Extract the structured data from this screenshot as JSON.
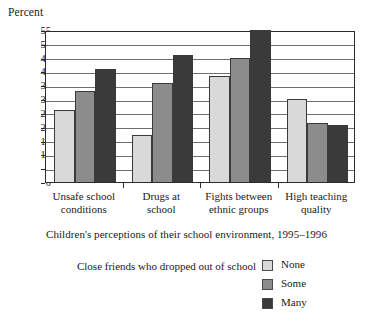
{
  "axis_title": "Percent",
  "caption": "Children's perceptions of their school environment, 1995–1996",
  "legend": {
    "title": "Close friends who dropped out of school",
    "items": [
      {
        "label": "None",
        "color": "#d9d9d9"
      },
      {
        "label": "Some",
        "color": "#8c8c8c"
      },
      {
        "label": "Many",
        "color": "#3a3a3a"
      }
    ]
  },
  "chart_data": {
    "type": "bar",
    "title": "",
    "subtitle": "Children's perceptions of their school environment, 1995–1996",
    "xlabel": "",
    "ylabel": "Percent",
    "ylim": [
      0,
      55
    ],
    "ytick_step": 5,
    "yticks": [
      0,
      5,
      10,
      15,
      20,
      25,
      30,
      35,
      40,
      45,
      50,
      55
    ],
    "grid": true,
    "grid_axis": "y",
    "legend_position": "bottom-right",
    "legend_title": "Close friends who dropped out of school",
    "categories": [
      "Unsafe school conditions",
      "Drugs at school",
      "Fights between ethnic groups",
      "High teaching quality"
    ],
    "category_lines": [
      [
        "Unsafe school",
        "conditions"
      ],
      [
        "Drugs at",
        "school"
      ],
      [
        "Fights between",
        "ethnic groups"
      ],
      [
        "High teaching",
        "quality"
      ]
    ],
    "series": [
      {
        "name": "None",
        "color": "#d9d9d9",
        "values": [
          26,
          17,
          38.5,
          30
        ]
      },
      {
        "name": "Some",
        "color": "#8c8c8c",
        "values": [
          33,
          36,
          45,
          21.5
        ]
      },
      {
        "name": "Many",
        "color": "#3a3a3a",
        "values": [
          41,
          46,
          55,
          20.5
        ]
      }
    ]
  }
}
